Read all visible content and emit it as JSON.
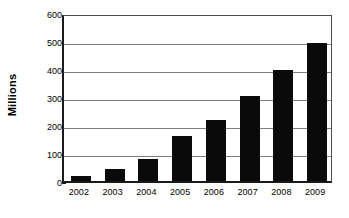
{
  "chart_data": {
    "type": "bar",
    "title": "",
    "xlabel": "",
    "ylabel": "Millions",
    "categories": [
      "2002",
      "2003",
      "2004",
      "2005",
      "2006",
      "2007",
      "2008",
      "2009"
    ],
    "values": [
      18,
      42,
      80,
      162,
      217,
      303,
      395,
      493
    ],
    "ylim": [
      0,
      600
    ],
    "ytick_labels": [
      "0",
      "100",
      "200",
      "300",
      "400",
      "500",
      "600"
    ],
    "ytick_values": [
      0,
      100,
      200,
      300,
      400,
      500,
      600
    ],
    "grid": true,
    "legend": "none",
    "bar_color": "#0a0a0a",
    "gridline_color": "#808080",
    "axis_color": "#1a1a1a",
    "background_color": "#ffffff"
  }
}
